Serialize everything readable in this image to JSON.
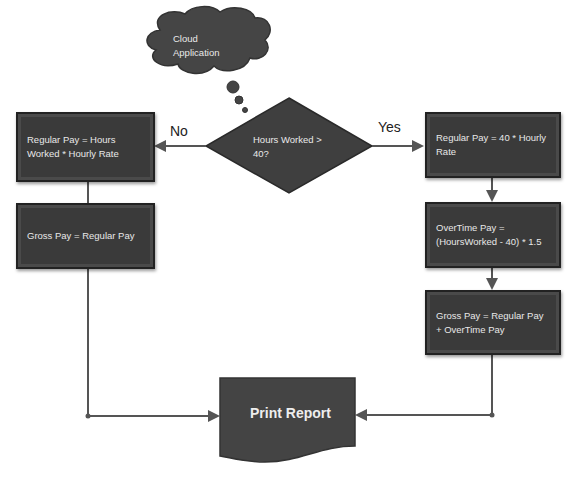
{
  "cloud": {
    "line1": "Cloud",
    "line2": "Application"
  },
  "decision": {
    "line1": "Hours Worked >",
    "line2": "40?"
  },
  "labels": {
    "no": "No",
    "yes": "Yes"
  },
  "left": {
    "regular_pay": "Regular Pay = Hours Worked * Hourly Rate",
    "gross_pay": "Gross Pay = Regular Pay"
  },
  "right": {
    "regular_pay": "Regular Pay = 40 * Hourly Rate",
    "overtime_pay": "OverTime Pay  = (HoursWorked - 40) * 1.5",
    "gross_pay": "Gross Pay = Regular Pay  + OverTime Pay"
  },
  "output": {
    "label": "Print Report"
  },
  "colors": {
    "shape_fill": "#3a3a3a",
    "line": "#555555",
    "text": "#e8e8e8"
  }
}
